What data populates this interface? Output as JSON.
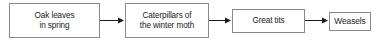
{
  "diagram": {
    "type": "flow-chain",
    "title": "",
    "orientation": "left-to-right",
    "background_color": "#ffffff",
    "border_color": "#8a8a8a",
    "text_color": "#1a1a1a",
    "arrow_color": "#1a1a1a",
    "nodes": [
      {
        "id": "oak-leaves",
        "label": "Oak leaves\nin spring"
      },
      {
        "id": "caterpillars",
        "label": "Caterpillars of\nthe winter moth"
      },
      {
        "id": "great-tits",
        "label": "Great tits"
      },
      {
        "id": "weasels",
        "label": "Weasels"
      }
    ],
    "edges": [
      {
        "id": "oak-to-caterpillars",
        "from": "oak-leaves",
        "to": "caterpillars",
        "style": "solid-arrow"
      },
      {
        "id": "caterpillars-to-tits",
        "from": "caterpillars",
        "to": "great-tits",
        "style": "solid-arrow"
      },
      {
        "id": "tits-to-weasels",
        "from": "great-tits",
        "to": "weasels",
        "style": "solid-arrow"
      }
    ]
  }
}
